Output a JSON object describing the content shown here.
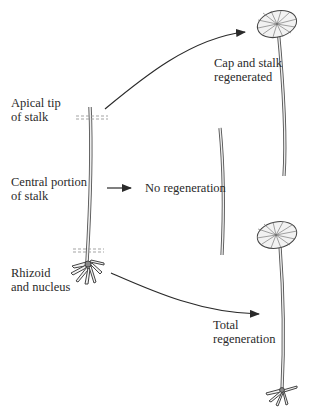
{
  "diagram": {
    "type": "regeneration experiment (Acetabularia)",
    "colors": {
      "ink": "#2a2a2a",
      "stalk_fill": "#e8e8e8",
      "cap_fill": "#f2f2f2",
      "nucleus": "#888888"
    },
    "source_segments": [
      {
        "id": "apical",
        "line1": "Apical tip",
        "line2": "of stalk"
      },
      {
        "id": "central",
        "line1": "Central portion",
        "line2": "of stalk"
      },
      {
        "id": "rhizoid",
        "line1": "Rhizoid",
        "line2": "and nucleus"
      }
    ],
    "outcomes": [
      {
        "from": "apical",
        "line1": "Cap and stalk",
        "line2": "regenerated",
        "result_icon": "cap-and-stalk-plant"
      },
      {
        "from": "central",
        "line1": "No regeneration",
        "result_icon": "stalk-fragment"
      },
      {
        "from": "rhizoid",
        "line1": "Total",
        "line2": "regeneration",
        "result_icon": "whole-plant"
      }
    ],
    "cut_marks": [
      "dashed-cut-upper",
      "dashed-cut-lower"
    ]
  }
}
